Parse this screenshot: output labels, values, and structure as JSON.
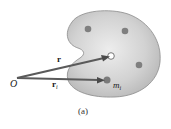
{
  "figure": {
    "caption": "(a)",
    "origin_label": "O",
    "vector_cm": {
      "label": "r"
    },
    "vector_i": {
      "label": "r",
      "subscript": "i"
    },
    "mass_label": {
      "main": "m",
      "subscript": "i"
    },
    "colors": {
      "body_fill": "#c8c8c8",
      "body_stroke": "#8a8a8a",
      "particle": "#7a7a7a",
      "vector": "#555555",
      "background": "#ffffff"
    }
  }
}
